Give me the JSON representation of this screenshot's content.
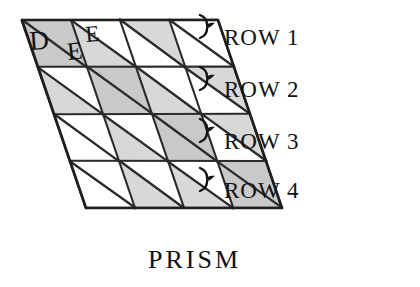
{
  "figure": {
    "caption": "PRISM",
    "cell_labels": [
      {
        "name": "label-d",
        "text": "D",
        "x": 30,
        "y": 50,
        "rotate": -4
      },
      {
        "name": "label-e-lower",
        "text": "E",
        "x": 68,
        "y": 60,
        "rotate": -6
      },
      {
        "name": "label-e-upper",
        "text": "E",
        "x": 86,
        "y": 42,
        "rotate": -5
      }
    ],
    "row_brackets": [
      {
        "name": "row-1",
        "label": "ROW 1",
        "brace_y": 36,
        "label_x": 224,
        "label_y": 45
      },
      {
        "name": "row-2",
        "label": "ROW 2",
        "brace_y": 88,
        "label_x": 224,
        "label_y": 97
      },
      {
        "name": "row-3",
        "label": "ROW 3",
        "brace_y": 140,
        "label_x": 224,
        "label_y": 149
      },
      {
        "name": "row-4",
        "label": "ROW 4",
        "brace_y": 189,
        "label_x": 224,
        "label_y": 198
      }
    ],
    "caption_pos": {
      "x": 148,
      "y": 268
    },
    "grid": {
      "rows": 4,
      "cols": 4,
      "origin_x": 22,
      "origin_y": 20,
      "cell_w": 49,
      "cell_h": 47,
      "shear_per_row": 16,
      "diagonal_direction": "nw-se",
      "shaded_cells": [
        {
          "row": 0,
          "col": 0,
          "part": "full"
        },
        {
          "row": 0,
          "col": 1,
          "part": "lower-left"
        },
        {
          "row": 0,
          "col": 2,
          "part": "upper-left"
        },
        {
          "row": 1,
          "col": 0,
          "part": "lower-left"
        },
        {
          "row": 1,
          "col": 1,
          "part": "full"
        },
        {
          "row": 1,
          "col": 2,
          "part": "lower-left"
        },
        {
          "row": 1,
          "col": 3,
          "part": "upper-left"
        },
        {
          "row": 2,
          "col": 1,
          "part": "lower-left"
        },
        {
          "row": 2,
          "col": 2,
          "part": "full"
        },
        {
          "row": 2,
          "col": 3,
          "part": "upper-left"
        },
        {
          "row": 3,
          "col": 1,
          "part": "lower-left"
        },
        {
          "row": 3,
          "col": 2,
          "part": "lower-left"
        },
        {
          "row": 3,
          "col": 3,
          "part": "full"
        }
      ]
    },
    "colors": {
      "ink": "#1e1e1e",
      "shade": "#c9c9c9",
      "shade_light": "#d8d8d8",
      "paper": "#ffffff"
    }
  }
}
